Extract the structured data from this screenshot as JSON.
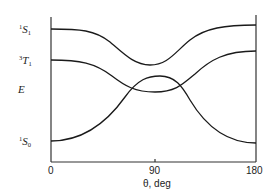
{
  "diagram": {
    "y_axis_label": "E",
    "x_axis_label": "θ, deg",
    "x_ticks": [
      "0",
      "90",
      "180"
    ],
    "states": [
      {
        "name": "S1",
        "sup": "1",
        "letter": "S",
        "sub": "1"
      },
      {
        "name": "T1",
        "sup": "3",
        "letter": "T",
        "sub": "1"
      },
      {
        "name": "S0",
        "sup": "1",
        "letter": "S",
        "sub": "0"
      }
    ],
    "curves": [
      {
        "name": "S1-curve",
        "description": "upper excited singlet, minimum near 90 deg"
      },
      {
        "name": "T1-curve",
        "description": "triplet, shallow minimum near 90 deg"
      },
      {
        "name": "S0-curve",
        "description": "ground state, maximum near 90 deg"
      }
    ]
  }
}
